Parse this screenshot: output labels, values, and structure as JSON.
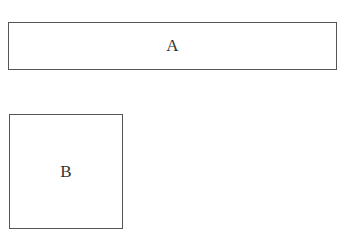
{
  "diagram": {
    "boxes": [
      {
        "id": "A",
        "label": "A",
        "shape": "wide-rectangle"
      },
      {
        "id": "B",
        "label": "B",
        "shape": "square"
      }
    ],
    "colors": {
      "border": "#555555",
      "text": "#333333",
      "background": "#ffffff"
    }
  }
}
